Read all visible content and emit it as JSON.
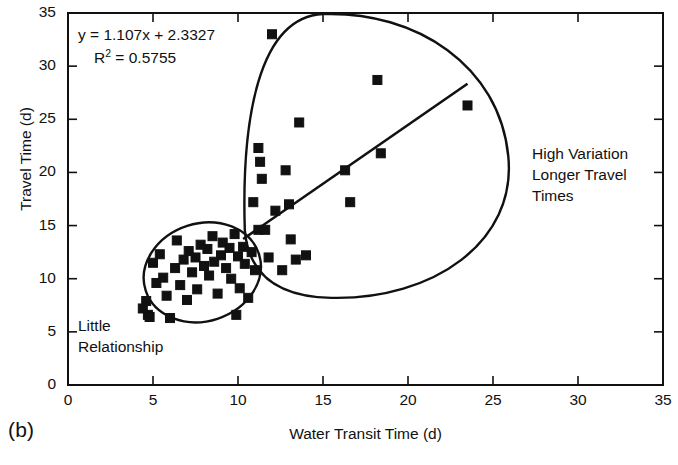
{
  "figure": {
    "panel_label": "(b)",
    "equation_line1": "y = 1.107x + 2.3327",
    "equation_r2_prefix": "R",
    "equation_r2_sup": "2",
    "equation_r2_value": " = 0.5755",
    "annotation_left": [
      "Little",
      "Relationship"
    ],
    "annotation_right": [
      "High Variation",
      "Longer Travel",
      "Times"
    ],
    "marker_color": "#111111",
    "line_color": "#111111",
    "axis_color": "#111111"
  },
  "chart_data": {
    "type": "scatter",
    "title": "",
    "xlabel": "Water Transit Time (d)",
    "ylabel": "Travel Time (d)",
    "xlim": [
      0,
      35
    ],
    "ylim": [
      0,
      35
    ],
    "xticks": [
      0,
      5,
      10,
      15,
      20,
      25,
      30,
      35
    ],
    "yticks": [
      0,
      5,
      10,
      15,
      20,
      25,
      30,
      35
    ],
    "grid": false,
    "legend": false,
    "marker": "square",
    "points": [
      [
        4.4,
        7.2
      ],
      [
        4.6,
        7.9
      ],
      [
        4.7,
        6.6
      ],
      [
        4.8,
        6.4
      ],
      [
        5.0,
        11.5
      ],
      [
        5.2,
        9.6
      ],
      [
        5.4,
        12.3
      ],
      [
        5.6,
        10.1
      ],
      [
        5.8,
        8.4
      ],
      [
        6.0,
        6.3
      ],
      [
        6.3,
        11.0
      ],
      [
        6.4,
        13.6
      ],
      [
        6.6,
        9.4
      ],
      [
        6.8,
        11.8
      ],
      [
        7.0,
        8.0
      ],
      [
        7.1,
        12.6
      ],
      [
        7.3,
        10.6
      ],
      [
        7.5,
        12.0
      ],
      [
        7.6,
        9.0
      ],
      [
        7.8,
        13.2
      ],
      [
        8.0,
        11.2
      ],
      [
        8.2,
        12.8
      ],
      [
        8.3,
        10.3
      ],
      [
        8.5,
        14.0
      ],
      [
        8.6,
        11.6
      ],
      [
        8.8,
        8.6
      ],
      [
        9.0,
        12.2
      ],
      [
        9.1,
        13.4
      ],
      [
        9.3,
        11.0
      ],
      [
        9.5,
        12.9
      ],
      [
        9.6,
        10.0
      ],
      [
        9.8,
        14.2
      ],
      [
        10.0,
        12.1
      ],
      [
        10.1,
        9.1
      ],
      [
        10.3,
        13.0
      ],
      [
        10.4,
        11.4
      ],
      [
        10.6,
        8.2
      ],
      [
        10.8,
        12.5
      ],
      [
        11.0,
        10.8
      ],
      [
        11.2,
        14.6
      ],
      [
        9.9,
        6.6
      ],
      [
        10.9,
        17.2
      ],
      [
        11.2,
        22.3
      ],
      [
        11.3,
        21.0
      ],
      [
        11.4,
        19.4
      ],
      [
        11.6,
        14.6
      ],
      [
        11.8,
        12.0
      ],
      [
        12.0,
        33.0
      ],
      [
        12.2,
        16.4
      ],
      [
        12.6,
        10.8
      ],
      [
        12.8,
        20.2
      ],
      [
        13.0,
        17.0
      ],
      [
        13.1,
        13.7
      ],
      [
        13.4,
        11.8
      ],
      [
        13.6,
        24.7
      ],
      [
        14.0,
        12.2
      ],
      [
        16.3,
        20.2
      ],
      [
        16.6,
        17.2
      ],
      [
        18.2,
        28.7
      ],
      [
        18.4,
        21.8
      ],
      [
        23.5,
        26.3
      ]
    ],
    "trendline": {
      "equation": "y = 1.107x + 2.3327",
      "r_squared": 0.5755,
      "slope": 1.107,
      "intercept": 2.3327,
      "x_start": 10.3,
      "x_end": 23.5
    },
    "regions": [
      {
        "label": "Little Relationship",
        "shape": "ellipse",
        "center": [
          7.9,
          10.6
        ],
        "rx": 3.5,
        "ry": 4.6
      },
      {
        "label": "High Variation Longer Travel Times",
        "shape": "blob",
        "center": [
          16.5,
          21.5
        ]
      }
    ]
  }
}
